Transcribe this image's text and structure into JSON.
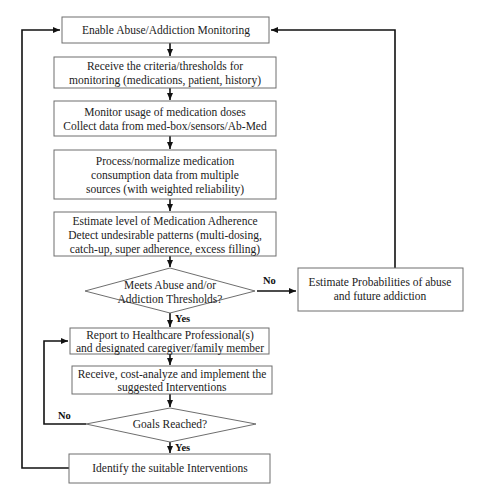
{
  "diagram": {
    "type": "flowchart",
    "nodes": [
      {
        "id": "enable",
        "shape": "rect",
        "lines": [
          "Enable Abuse/Addiction  Monitoring"
        ]
      },
      {
        "id": "receive_criteria",
        "shape": "rect",
        "lines": [
          "Receive the criteria/thresholds  for",
          "monitoring (medications,  patient,  history)"
        ]
      },
      {
        "id": "monitor",
        "shape": "rect",
        "lines": [
          "Monitor usage of medication doses",
          "Collect data from med-box/sensors/Ab-Med"
        ]
      },
      {
        "id": "process",
        "shape": "rect",
        "lines": [
          "Process/normalize  medication",
          "consumption data from multiple",
          "sources (with weighted reliability)"
        ]
      },
      {
        "id": "estimate",
        "shape": "rect",
        "lines": [
          "Estimate level of Medication  Adherence",
          "Detect undesirable patterns (multi-dosing,",
          "catch-up,  super adherence,  excess filling)"
        ]
      },
      {
        "id": "meets_thresholds",
        "shape": "diamond",
        "lines": [
          "Meets Abuse and/or",
          "Addiction Thresholds?"
        ]
      },
      {
        "id": "estimate_prob",
        "shape": "rect",
        "lines": [
          "Estimate Probabilities of abuse",
          "and future addiction"
        ]
      },
      {
        "id": "report",
        "shape": "rect",
        "lines": [
          "Report to Healthcare  Professional(s)",
          "and designated  caregiver/family  member"
        ]
      },
      {
        "id": "implement",
        "shape": "rect",
        "lines": [
          "Receive,  cost-analyze  and implement  the",
          "suggested  Interventions"
        ]
      },
      {
        "id": "goals",
        "shape": "diamond",
        "lines": [
          "Goals Reached?"
        ]
      },
      {
        "id": "identify",
        "shape": "rect",
        "lines": [
          "Identify  the  suitable  Interventions"
        ]
      }
    ],
    "edge_labels": {
      "meets_no": "No",
      "meets_yes": "Yes",
      "goals_no": "No",
      "goals_yes": "Yes"
    },
    "edges": [
      {
        "from": "enable",
        "to": "receive_criteria"
      },
      {
        "from": "receive_criteria",
        "to": "monitor"
      },
      {
        "from": "monitor",
        "to": "process"
      },
      {
        "from": "process",
        "to": "estimate"
      },
      {
        "from": "estimate",
        "to": "meets_thresholds"
      },
      {
        "from": "meets_thresholds",
        "to": "estimate_prob",
        "label": "No"
      },
      {
        "from": "estimate_prob",
        "to": "enable"
      },
      {
        "from": "meets_thresholds",
        "to": "report",
        "label": "Yes"
      },
      {
        "from": "report",
        "to": "implement"
      },
      {
        "from": "implement",
        "to": "goals"
      },
      {
        "from": "goals",
        "to": "report",
        "label": "No"
      },
      {
        "from": "goals",
        "to": "identify",
        "label": "Yes"
      },
      {
        "from": "identify",
        "to": "enable"
      }
    ]
  }
}
